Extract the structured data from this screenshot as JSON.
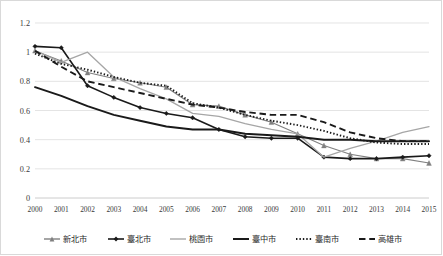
{
  "chart_data": {
    "type": "line",
    "title": "",
    "subtitle": "",
    "xlabel": "",
    "ylabel": "",
    "x": [
      2000,
      2001,
      2002,
      2003,
      2004,
      2005,
      2006,
      2007,
      2008,
      2009,
      2010,
      2011,
      2012,
      2013,
      2014,
      2015
    ],
    "xtick_labels": [
      "2000",
      "2001",
      "2002",
      "2003",
      "2004",
      "2005",
      "2006",
      "2007",
      "2008",
      "2009",
      "2010",
      "2011",
      "2012",
      "2013",
      "2014",
      "2015"
    ],
    "ylim": [
      0,
      1.2
    ],
    "ytick_labels": [
      "0",
      "0.2",
      "0.4",
      "0.6",
      "0.8",
      "1",
      "1.2"
    ],
    "ytick_values": [
      0,
      0.2,
      0.4,
      0.6,
      0.8,
      1.0,
      1.2
    ],
    "grid": "horizontal",
    "legend_position": "bottom",
    "series": [
      {
        "name": "新北市",
        "color": "#808080",
        "style": "solid",
        "marker": "triangle",
        "width": 1.1,
        "values": [
          1.01,
          0.94,
          0.86,
          0.82,
          0.79,
          0.76,
          0.64,
          0.63,
          0.57,
          0.52,
          0.44,
          0.36,
          0.3,
          0.27,
          0.27,
          0.24
        ]
      },
      {
        "name": "臺北市",
        "color": "#1a1a1a",
        "style": "solid",
        "marker": "diamond",
        "width": 1.6,
        "values": [
          1.04,
          1.03,
          0.77,
          0.69,
          0.62,
          0.58,
          0.55,
          0.47,
          0.42,
          0.41,
          0.41,
          0.28,
          0.27,
          0.27,
          0.28,
          0.29
        ]
      },
      {
        "name": "桃園市",
        "color": "#a6a6a6",
        "style": "solid",
        "marker": "none",
        "width": 1.3,
        "values": [
          1.01,
          0.93,
          1.0,
          0.83,
          0.75,
          0.68,
          0.58,
          0.56,
          0.51,
          0.47,
          0.44,
          0.28,
          0.34,
          0.39,
          0.45,
          0.49
        ]
      },
      {
        "name": "臺中市",
        "color": "#1a1a1a",
        "style": "solid",
        "marker": "none",
        "width": 2.0,
        "values": [
          0.76,
          0.7,
          0.63,
          0.57,
          0.53,
          0.49,
          0.47,
          0.47,
          0.44,
          0.43,
          0.42,
          0.4,
          0.4,
          0.39,
          0.39,
          0.39
        ]
      },
      {
        "name": "臺南市",
        "color": "#1a1a1a",
        "style": "dotted",
        "marker": "none",
        "width": 1.9,
        "values": [
          0.99,
          0.92,
          0.88,
          0.83,
          0.79,
          0.77,
          0.65,
          0.62,
          0.57,
          0.53,
          0.5,
          0.46,
          0.41,
          0.38,
          0.37,
          0.37
        ]
      },
      {
        "name": "高雄市",
        "color": "#1a1a1a",
        "style": "dashed",
        "marker": "none",
        "width": 1.9,
        "values": [
          1.01,
          0.9,
          0.8,
          0.76,
          0.72,
          0.68,
          0.64,
          0.62,
          0.59,
          0.57,
          0.57,
          0.52,
          0.45,
          0.41,
          0.39,
          0.39
        ]
      }
    ]
  }
}
